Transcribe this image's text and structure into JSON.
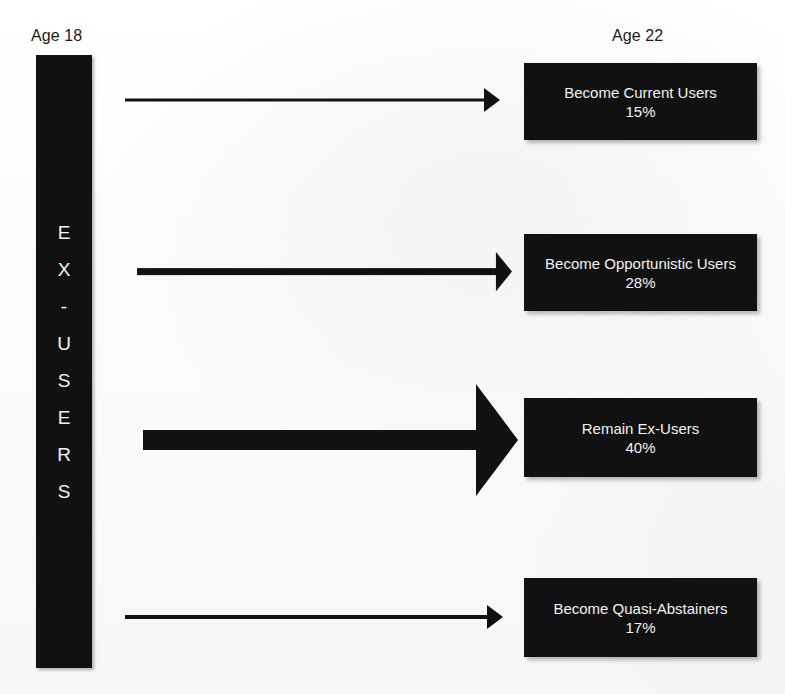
{
  "columns": {
    "left_label": "Age 18",
    "right_label": "Age 22"
  },
  "source": {
    "name": "EX-USERS",
    "letters": [
      "E",
      "X",
      "-",
      "U",
      "S",
      "E",
      "R",
      "S"
    ]
  },
  "colors": {
    "box_fill": "#111111",
    "box_text": "#f2f2f2",
    "arrow": "#111111",
    "page_background": "#fdfdfd",
    "label_text": "#1a1a1a"
  },
  "flows": [
    {
      "label": "Become Current Users",
      "percent_text": "15%",
      "percent_value": 15,
      "arrow_thickness": 3
    },
    {
      "label": "Become Opportunistic Users",
      "percent_text": "28%",
      "percent_value": 28,
      "arrow_thickness": 7
    },
    {
      "label": "Remain Ex-Users",
      "percent_text": "40%",
      "percent_value": 40,
      "arrow_thickness": 20
    },
    {
      "label": "Become Quasi-Abstainers",
      "percent_text": "17%",
      "percent_value": 17,
      "arrow_thickness": 4
    }
  ],
  "chart_data": {
    "type": "diagram",
    "source_category": "EX-USERS",
    "from_label": "Age 18",
    "to_label": "Age 22",
    "categories": [
      "Become Current Users",
      "Become Opportunistic Users",
      "Remain Ex-Users",
      "Become Quasi-Abstainers"
    ],
    "values": [
      15,
      28,
      40,
      17
    ],
    "unit": "%",
    "total": 100
  }
}
